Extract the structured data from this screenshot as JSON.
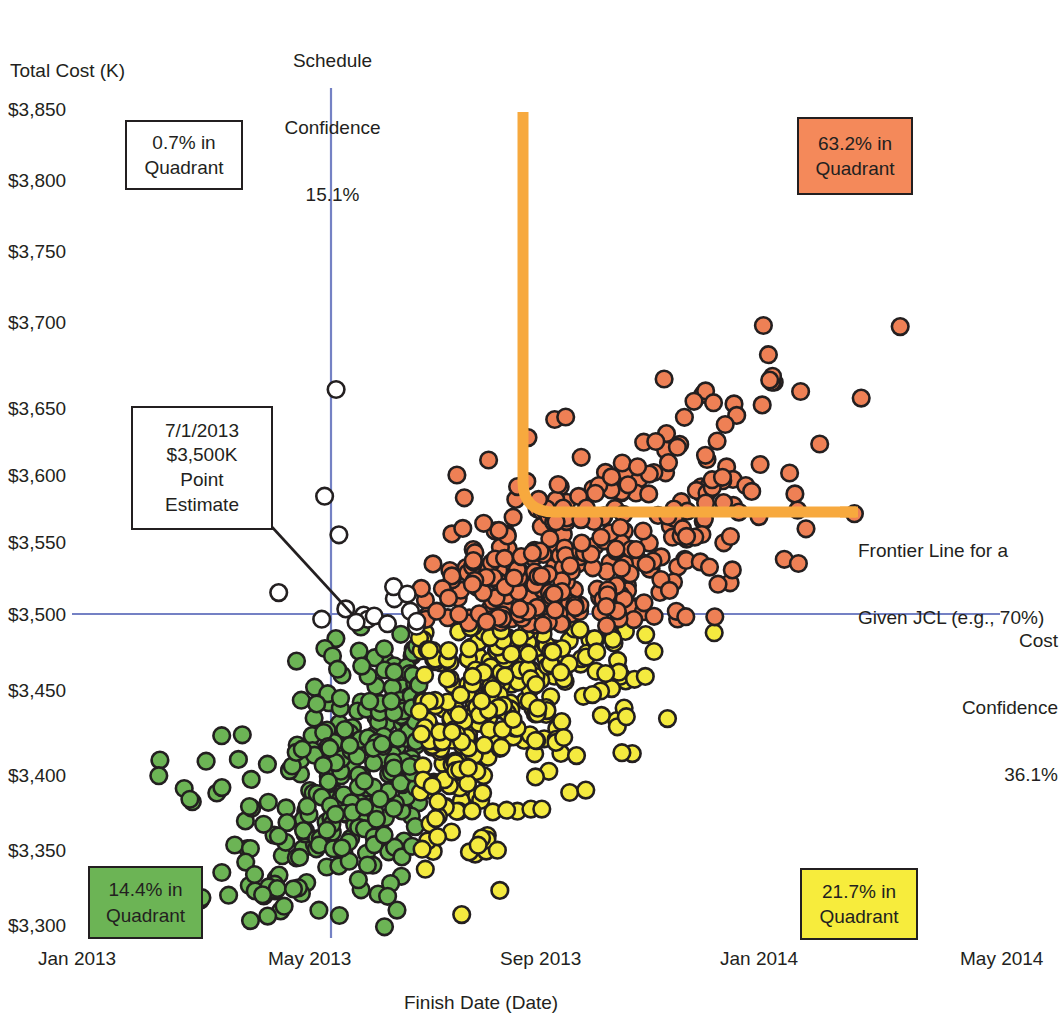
{
  "axes": {
    "y_title": "Total Cost (K)",
    "x_title": "Finish Date (Date)",
    "y_ticks": [
      "$3,850",
      "$3,800",
      "$3,750",
      "$3,700",
      "$3,650",
      "$3,600",
      "$3,550",
      "$3,500",
      "$3,450",
      "$3,400",
      "$3,350",
      "$3,300"
    ],
    "x_ticks": [
      "Jan 2013",
      "May 2013",
      "Sep 2013",
      "Jan 2014",
      "May 2014"
    ]
  },
  "annotations": {
    "schedule_confidence": {
      "line1": "Schedule",
      "line2": "Confidence",
      "value": "15.1%"
    },
    "cost_confidence": {
      "line1": "Cost",
      "line2": "Confidence",
      "value": "36.1%"
    },
    "frontier": {
      "line1": "Frontier Line for a",
      "line2": "Given JCL (e.g., 70%)"
    },
    "point_estimate": {
      "date": "7/1/2013",
      "cost": "$3,500K",
      "line3": "Point",
      "line4": "Estimate"
    }
  },
  "quadrants": [
    {
      "id": "upper-left",
      "value": "0.7% in",
      "label": "Quadrant",
      "fill": "#ffffff"
    },
    {
      "id": "upper-right",
      "value": "63.2% in",
      "label": "Quadrant",
      "fill": "#F4895A"
    },
    {
      "id": "lower-left",
      "value": "14.4% in",
      "label": "Quadrant",
      "fill": "#6CB455"
    },
    {
      "id": "lower-right",
      "value": "21.7% in",
      "label": "Quadrant",
      "fill": "#F7EC3C"
    }
  ],
  "colors": {
    "orange_point": "#EE8055",
    "green_point": "#6CB455",
    "yellow_point": "#F4EA3F",
    "open_point": "#ffffff",
    "point_outline": "#231f20",
    "confidence_line": "#7481C4",
    "frontier_line": "#F7A93E",
    "box_outline": "#231f20"
  },
  "chart_data": {
    "type": "scatter",
    "title": "",
    "xlabel": "Finish Date (Date)",
    "ylabel": "Total Cost (K)",
    "xlim": [
      "Jan 2013",
      "May 2014"
    ],
    "ylim": [
      3280,
      3870
    ],
    "ytick_values": [
      3850,
      3800,
      3750,
      3700,
      3650,
      3600,
      3550,
      3500,
      3450,
      3400,
      3350,
      3300
    ],
    "xtick_labels": [
      "Jan 2013",
      "May 2013",
      "Sep 2013",
      "Jan 2014",
      "May 2014"
    ],
    "grid": false,
    "legend": "none",
    "reference_lines": [
      {
        "name": "Schedule Confidence",
        "orientation": "vertical",
        "x": "May 2013",
        "value_pct": 15.1,
        "color": "#7481C4"
      },
      {
        "name": "Cost Confidence",
        "orientation": "horizontal",
        "y": 3500,
        "value_pct": 36.1,
        "color": "#7481C4"
      }
    ],
    "frontier_line": {
      "name": "Frontier Line for a Given JCL (e.g., 70%)",
      "color": "#F7A93E",
      "shape": "L-elbow",
      "vertical_x": "Jul 2013",
      "vertical_y_top": 3860,
      "elbow_y": 3585,
      "horizontal_x_right": "Jan 2014"
    },
    "point_estimate": {
      "x": "7/1/2013",
      "y": 3500,
      "label": "7/1/2013 $3,500K Point Estimate"
    },
    "quadrant_shares_pct": {
      "upper_left": 0.7,
      "upper_right": 63.2,
      "lower_left": 14.4,
      "lower_right": 21.7
    },
    "series": [
      {
        "name": "Above cost & late (orange)",
        "color": "#EE8055",
        "share_pct": 63.2,
        "n_approx": 632
      },
      {
        "name": "Below cost & late (yellow)",
        "color": "#F4EA3F",
        "share_pct": 21.7,
        "n_approx": 217
      },
      {
        "name": "Below cost & early (green)",
        "color": "#6CB455",
        "share_pct": 14.4,
        "n_approx": 144
      },
      {
        "name": "Above cost & early (open)",
        "color": "#ffffff",
        "share_pct": 0.7,
        "n_approx": 7
      }
    ]
  }
}
